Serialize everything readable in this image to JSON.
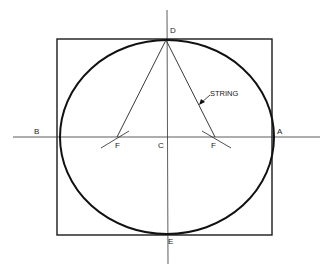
{
  "diagram": {
    "colors": {
      "stroke": "#1a1a1a",
      "background": "#ffffff"
    },
    "labels": {
      "A": "A",
      "B": "B",
      "C": "C",
      "D": "D",
      "E": "E",
      "F_left": "F",
      "F_right": "F",
      "string": "STRING"
    },
    "geometry": {
      "center": [
        167,
        137
      ],
      "semi_major": 106,
      "semi_minor": 97,
      "foci": [
        [
          117,
          137
        ],
        [
          215,
          137
        ]
      ],
      "square": {
        "x": 57,
        "y": 38,
        "width": 215,
        "height": 197
      }
    }
  }
}
